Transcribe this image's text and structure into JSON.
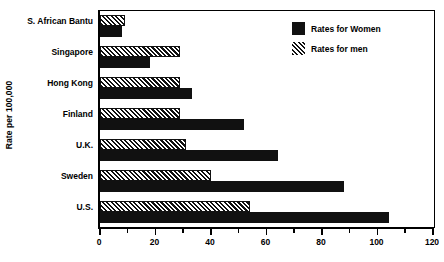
{
  "chart_data": {
    "type": "bar",
    "orientation": "horizontal",
    "title": "",
    "xlabel": "",
    "ylabel": "Rate per 100,000",
    "xlim": [
      0,
      120
    ],
    "grid": false,
    "legend_position": "top-right",
    "x_ticks_major": [
      0,
      20,
      40,
      60,
      80,
      100,
      120
    ],
    "x_ticks_major_labels": [
      "0",
      "20",
      "40",
      "60",
      "80",
      "100",
      "120"
    ],
    "x_ticks_minor": [
      10,
      30,
      50,
      70,
      90,
      110
    ],
    "categories": [
      "S. African Bantu",
      "Singapore",
      "Hong Kong",
      "Finland",
      "U.K.",
      "Sweden",
      "U.S."
    ],
    "series": [
      {
        "name": "Rates for men",
        "style": "hatched",
        "values": [
          9,
          29,
          29,
          29,
          31,
          40,
          54
        ]
      },
      {
        "name": "Rates for Women",
        "style": "solid",
        "values": [
          8,
          18,
          33,
          52,
          64,
          88,
          104
        ]
      }
    ]
  },
  "legend": {
    "items": [
      {
        "label": "Rates for Women",
        "swatch": "solid"
      },
      {
        "label": "Rates for men",
        "swatch": "hatched"
      }
    ]
  }
}
